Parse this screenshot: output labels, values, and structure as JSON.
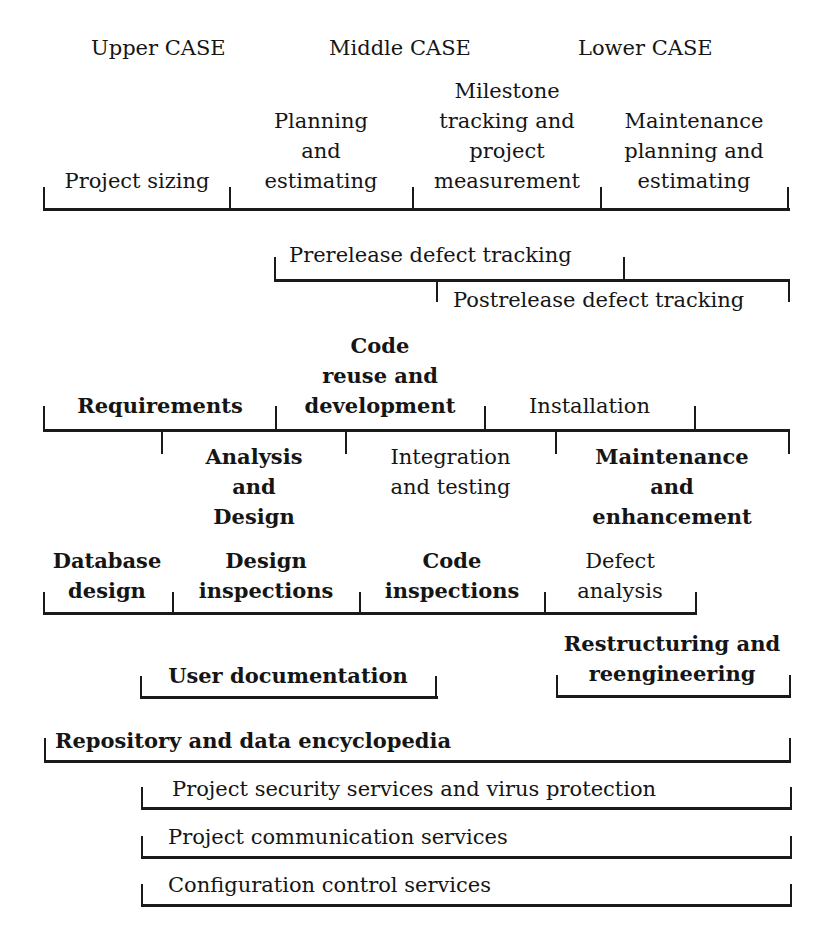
{
  "diagram": {
    "headers": {
      "upper": "Upper CASE",
      "middle": "Middle CASE",
      "lower": "Lower CASE"
    },
    "management": {
      "project_sizing": "Project sizing",
      "planning": [
        "Planning",
        "and",
        "estimating"
      ],
      "milestone": [
        "Milestone",
        "tracking and",
        "project",
        "measurement"
      ],
      "maintenance_planning": [
        "Maintenance",
        "planning and",
        "estimating"
      ]
    },
    "defects": {
      "prerelease": "Prerelease defect tracking",
      "postrelease": "Postrelease defect tracking"
    },
    "lifecycle": {
      "requirements": "Requirements",
      "code_reuse": [
        "Code",
        "reuse and",
        "development"
      ],
      "installation": "Installation",
      "analysis_design": [
        "Analysis",
        "and",
        "Design"
      ],
      "integration": [
        "Integration",
        "and testing"
      ],
      "maintenance": [
        "Maintenance",
        "and",
        "enhancement"
      ]
    },
    "quality": {
      "database_design": [
        "Database",
        "design"
      ],
      "design_inspections": [
        "Design",
        "inspections"
      ],
      "code_inspections": [
        "Code",
        "inspections"
      ],
      "defect_analysis": [
        "Defect",
        "analysis"
      ]
    },
    "support": {
      "user_documentation": "User documentation",
      "restructuring": [
        "Restructuring and",
        "reengineering"
      ]
    },
    "services": {
      "repository": "Repository and data encyclopedia",
      "security": "Project security services and virus protection",
      "communication": "Project communication services",
      "configuration": "Configuration control services"
    }
  }
}
